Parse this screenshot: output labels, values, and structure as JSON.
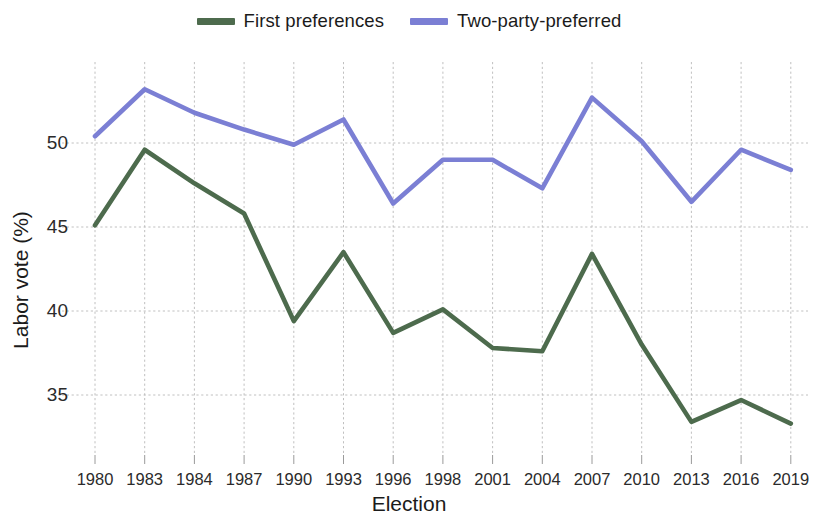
{
  "chart_data": {
    "type": "line",
    "title": "",
    "xlabel": "Election",
    "ylabel": "Labor vote (%)",
    "categories": [
      "1980",
      "1983",
      "1984",
      "1987",
      "1990",
      "1993",
      "1996",
      "1998",
      "2001",
      "2004",
      "2007",
      "2010",
      "2013",
      "2016",
      "2019"
    ],
    "ylim": [
      32.2,
      54.5
    ],
    "yticks": [
      35,
      40,
      45,
      50
    ],
    "ytick_labels": [
      "35",
      "40",
      "45",
      "50"
    ],
    "grid": true,
    "legend_position": "top-center",
    "series": [
      {
        "name": "First preferences",
        "color": "#4d6b4d",
        "values": [
          45.1,
          49.6,
          47.6,
          45.8,
          39.4,
          43.5,
          38.7,
          40.1,
          37.8,
          37.6,
          43.4,
          38.0,
          33.4,
          34.7,
          33.3
        ]
      },
      {
        "name": "Two-party-preferred",
        "color": "#7b7fd4",
        "values": [
          50.4,
          53.2,
          51.8,
          50.8,
          49.9,
          51.4,
          46.4,
          49.0,
          49.0,
          47.3,
          52.7,
          50.1,
          46.5,
          49.6,
          48.4
        ]
      }
    ]
  },
  "legend": {
    "entries": [
      {
        "label": "First preferences",
        "color": "#4d6b4d"
      },
      {
        "label": "Two-party-preferred",
        "color": "#7b7fd4"
      }
    ]
  },
  "axes": {
    "x_title": "Election",
    "y_title": "Labor vote (%)"
  },
  "colors": {
    "first_preferences": "#4d6b4d",
    "two_party_preferred": "#7b7fd4",
    "grid": "#b9b9b9",
    "text": "#1b1b1b",
    "background": "#ffffff"
  }
}
